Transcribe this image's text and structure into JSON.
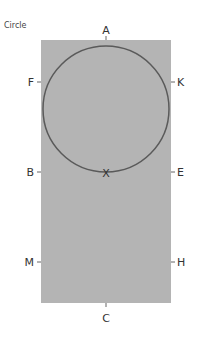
{
  "title": "Circle",
  "colors": {
    "field": "#b4b4b4",
    "circle_stroke": "#5a5a5a",
    "label": "#333333"
  },
  "labels": {
    "top": "A",
    "left_upper": "F",
    "right_upper": "K",
    "left_middle": "B",
    "right_middle": "E",
    "center": "X",
    "left_lower": "M",
    "right_lower": "H",
    "bottom": "C"
  }
}
